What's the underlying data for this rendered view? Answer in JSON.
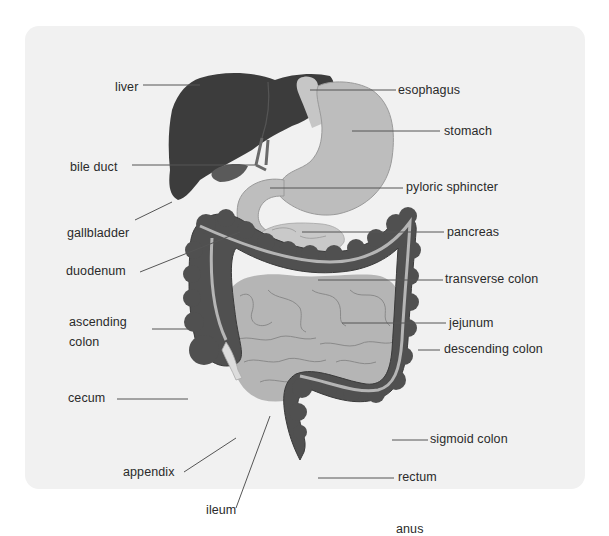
{
  "diagram": {
    "colors": {
      "panel_background": "#f1f1f1",
      "liver": "#3c3c3c",
      "colon": "#505050",
      "colon_stripe": "#b5b5b5",
      "stomach": "#bdbdbd",
      "small_intestine": "#b3b3b3",
      "pancreas": "#c8c8c8",
      "appendix": "#dcdcdc",
      "leader_line": "#555555",
      "label_text": "#2a2a2a"
    },
    "labels_left": [
      {
        "id": "liver",
        "text": "liver"
      },
      {
        "id": "bile-duct",
        "text": "bile duct"
      },
      {
        "id": "gallbladder",
        "text": "gallbladder"
      },
      {
        "id": "duodenum",
        "text": "duodenum"
      },
      {
        "id": "ascending-colon",
        "text": "ascending",
        "text2": "colon"
      },
      {
        "id": "cecum",
        "text": "cecum"
      },
      {
        "id": "appendix",
        "text": "appendix"
      },
      {
        "id": "ileum",
        "text": "ileum"
      }
    ],
    "labels_right": [
      {
        "id": "esophagus",
        "text": "esophagus"
      },
      {
        "id": "stomach",
        "text": "stomach"
      },
      {
        "id": "pyloric-sphincter",
        "text": "pyloric sphincter"
      },
      {
        "id": "pancreas",
        "text": "pancreas"
      },
      {
        "id": "transverse-colon",
        "text": "transverse colon"
      },
      {
        "id": "jejunum",
        "text": "jejunum"
      },
      {
        "id": "descending-colon",
        "text": "descending colon"
      },
      {
        "id": "sigmoid-colon",
        "text": "sigmoid colon"
      },
      {
        "id": "rectum",
        "text": "rectum"
      },
      {
        "id": "anus",
        "text": "anus"
      }
    ]
  }
}
